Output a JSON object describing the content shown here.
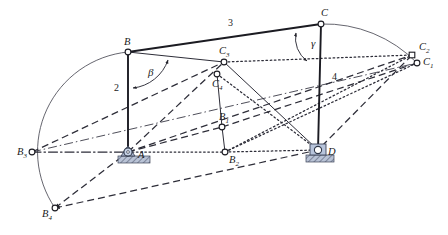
{
  "figure": {
    "type": "kinematic-linkage-diagram",
    "background_color": "#ffffff",
    "line_color": "#23232b",
    "joint_fill": "#ffffff",
    "support_color": "#8e9fc0"
  },
  "points": [
    {
      "id": "A",
      "label": "A",
      "sub": "",
      "x": 128,
      "y": 152,
      "marker": "ground-pivot",
      "label_dx": 10,
      "label_dy": 6
    },
    {
      "id": "B",
      "label": "B",
      "sub": "",
      "x": 128,
      "y": 52,
      "marker": "circle",
      "label_dx": -4,
      "label_dy": -7
    },
    {
      "id": "C",
      "label": "C",
      "sub": "",
      "x": 321,
      "y": 24,
      "marker": "circle",
      "label_dx": 0,
      "label_dy": -8
    },
    {
      "id": "D",
      "label": "D",
      "sub": "",
      "x": 318,
      "y": 150,
      "marker": "ground-pivot",
      "label_dx": 10,
      "label_dy": 5
    },
    {
      "id": "B1",
      "label": "B",
      "sub": "1",
      "x": 222,
      "y": 127,
      "marker": "circle",
      "label_dx": -3,
      "label_dy": -7
    },
    {
      "id": "B2",
      "label": "B",
      "sub": "2",
      "x": 225,
      "y": 152,
      "marker": "circle",
      "label_dx": 4,
      "label_dy": 11
    },
    {
      "id": "B3",
      "label": "B",
      "sub": "3",
      "x": 32,
      "y": 152,
      "marker": "circle",
      "label_dx": -15,
      "label_dy": 3
    },
    {
      "id": "B4",
      "label": "B",
      "sub": "4",
      "x": 55,
      "y": 208,
      "marker": "circle",
      "label_dx": -13,
      "label_dy": 9
    },
    {
      "id": "C1",
      "label": "C",
      "sub": "1",
      "x": 417,
      "y": 63,
      "marker": "circle",
      "label_dx": 6,
      "label_dy": 2
    },
    {
      "id": "C2",
      "label": "C",
      "sub": "2",
      "x": 412,
      "y": 55,
      "marker": "square",
      "label_dx": 7,
      "label_dy": -5
    },
    {
      "id": "C3",
      "label": "C",
      "sub": "3",
      "x": 224,
      "y": 62,
      "marker": "circle",
      "label_dx": -5,
      "label_dy": -8
    },
    {
      "id": "C4",
      "label": "C",
      "sub": "4",
      "x": 217,
      "y": 74,
      "marker": "circle",
      "label_dx": -5,
      "label_dy": 13
    }
  ],
  "links": [
    {
      "name": "crank-2-AB",
      "label": "2",
      "from": "A",
      "to": "B",
      "style": "solid",
      "label_x": 114,
      "label_y": 91
    },
    {
      "name": "coupler-3-BC",
      "label": "3",
      "from": "B",
      "to": "C",
      "style": "solid",
      "label_x": 228,
      "label_y": 26
    },
    {
      "name": "rocker-4-CD",
      "label": "4",
      "from": "C",
      "to": "D",
      "style": "solid",
      "label_x": 332,
      "label_y": 80
    }
  ],
  "angles": [
    {
      "name": "beta",
      "symbol": "β",
      "vertex": "B",
      "label_x": 148,
      "label_y": 76
    },
    {
      "name": "gamma",
      "symbol": "γ",
      "vertex": "C",
      "label_x": 311,
      "label_y": 47
    }
  ],
  "arcs": [
    {
      "name": "arc-B-path",
      "center": "A",
      "from": "B",
      "to": "B4",
      "style": "solid-thin"
    },
    {
      "name": "arc-C-path",
      "center": "D",
      "from": "C",
      "to": "C1",
      "style": "solid-thin"
    },
    {
      "name": "arc-beta",
      "center": "B",
      "style": "angle-arc"
    },
    {
      "name": "arc-gamma",
      "center": "C",
      "style": "angle-arc"
    }
  ],
  "construction_lines": [
    {
      "name": "dashdot-B3-to-C1",
      "from": "B3",
      "to": "C1",
      "style": "dashdot"
    },
    {
      "name": "dashed-B3-to-C3",
      "from": "B3",
      "to": "C3",
      "style": "dashed"
    },
    {
      "name": "dashed-B4-to-A",
      "from": "B4",
      "to": "A",
      "style": "dashed"
    },
    {
      "name": "dashed-B4-to-D",
      "from": "B4",
      "to": "D",
      "style": "dashed"
    },
    {
      "name": "dashed-A-to-C3",
      "from": "A",
      "to": "C3",
      "style": "dashed"
    },
    {
      "name": "dashed-A-to-C2",
      "from": "A",
      "to": "C2",
      "style": "dashed"
    },
    {
      "name": "dashed-B1-to-C1",
      "from": "B1",
      "to": "C1",
      "style": "dashed"
    },
    {
      "name": "dotted-A-to-B2",
      "from": "A",
      "to": "B2",
      "style": "dotted"
    },
    {
      "name": "dotted-B2-to-C2",
      "from": "B2",
      "to": "C2",
      "style": "dotted"
    },
    {
      "name": "dotted-B2-to-D",
      "from": "B2",
      "to": "D",
      "style": "dotted"
    },
    {
      "name": "dotted-C4-to-D",
      "from": "C4",
      "to": "D",
      "style": "dotted"
    },
    {
      "name": "dotted-C3-to-C2",
      "from": "C3",
      "to": "C2",
      "style": "dotted"
    },
    {
      "name": "solid-B1-to-C4",
      "from": "B1",
      "to": "C4",
      "style": "solid-thin"
    },
    {
      "name": "solid-C3-to-D",
      "from": "C3",
      "to": "D",
      "style": "solid-thin"
    }
  ]
}
